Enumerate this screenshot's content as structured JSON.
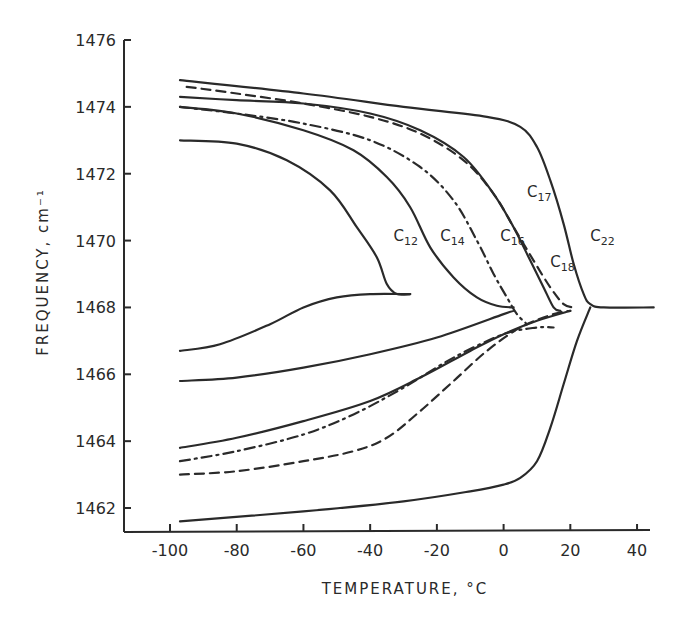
{
  "chart_data": {
    "type": "line",
    "title": "",
    "xlabel": "TEMPERATURE, °C",
    "ylabel": "FREQUENCY, cm⁻¹",
    "xlim": [
      -112,
      46
    ],
    "ylim": [
      1461.3,
      1476
    ],
    "x_ticks": [
      -100,
      -80,
      -60,
      -40,
      -20,
      0,
      20,
      40
    ],
    "x_tick_labels": [
      "-100",
      "-80",
      "-60",
      "-40",
      "-20",
      "0",
      "20",
      "40"
    ],
    "y_ticks": [
      1476,
      1474,
      1472,
      1470,
      1468,
      1466,
      1464,
      1462
    ],
    "y_tick_labels": [
      "1476",
      "1474",
      "1472",
      "1470",
      "1468",
      "1466",
      "1464",
      "1462"
    ],
    "grid": false,
    "legend": "inline curve labels",
    "series": [
      {
        "name": "C12",
        "label_main": "C",
        "label_sub": "12",
        "style": "solid",
        "branch": "upper",
        "x": [
          -97,
          -80,
          -65,
          -52,
          -44,
          -38,
          -35,
          -32,
          -28
        ],
        "y": [
          1473.0,
          1472.9,
          1472.4,
          1471.5,
          1470.4,
          1469.5,
          1468.7,
          1468.4,
          1468.4
        ]
      },
      {
        "name": "C12",
        "label_main": "C",
        "label_sub": "12",
        "style": "solid",
        "branch": "lower",
        "x": [
          -97,
          -85,
          -70,
          -60,
          -50,
          -40,
          -28
        ],
        "y": [
          1466.7,
          1466.9,
          1467.5,
          1468.0,
          1468.3,
          1468.4,
          1468.4
        ]
      },
      {
        "name": "C14",
        "label_main": "C",
        "label_sub": "14",
        "style": "solid",
        "branch": "upper",
        "x": [
          -97,
          -80,
          -60,
          -45,
          -35,
          -28,
          -22,
          -15,
          -8,
          -2,
          3
        ],
        "y": [
          1474.0,
          1473.8,
          1473.3,
          1472.7,
          1471.9,
          1471.0,
          1469.8,
          1468.9,
          1468.3,
          1468.05,
          1468.0
        ]
      },
      {
        "name": "C14",
        "label_main": "C",
        "label_sub": "14",
        "style": "solid",
        "branch": "lower",
        "x": [
          -97,
          -80,
          -60,
          -40,
          -20,
          0,
          3
        ],
        "y": [
          1465.8,
          1465.9,
          1466.2,
          1466.6,
          1467.1,
          1467.8,
          1467.9
        ]
      },
      {
        "name": "C16",
        "label_main": "C",
        "label_sub": "16",
        "style": "dashdot",
        "branch": "upper",
        "x": [
          -97,
          -80,
          -60,
          -40,
          -25,
          -15,
          -8,
          -3,
          1,
          4,
          7
        ],
        "y": [
          1474.0,
          1473.8,
          1473.5,
          1473.0,
          1472.2,
          1471.2,
          1470.0,
          1469.0,
          1468.3,
          1467.8,
          1467.5
        ]
      },
      {
        "name": "C16",
        "label_main": "C",
        "label_sub": "16",
        "style": "dashdot",
        "branch": "lower",
        "x": [
          -97,
          -80,
          -60,
          -45,
          -30,
          -15,
          0,
          10,
          15
        ],
        "y": [
          1463.4,
          1463.7,
          1464.2,
          1464.8,
          1465.6,
          1466.5,
          1467.2,
          1467.4,
          1467.4
        ]
      },
      {
        "name": "C17",
        "label_main": "C",
        "label_sub": "17",
        "style": "solid",
        "branch": "upper",
        "x": [
          -97,
          -80,
          -60,
          -40,
          -25,
          -12,
          -3,
          3,
          8,
          12,
          15,
          17
        ],
        "y": [
          1474.3,
          1474.2,
          1474.1,
          1473.8,
          1473.3,
          1472.5,
          1471.4,
          1470.4,
          1469.4,
          1468.6,
          1468.0,
          1467.9
        ]
      },
      {
        "name": "C17",
        "label_main": "C",
        "label_sub": "17",
        "style": "solid",
        "branch": "lower",
        "x": [
          -97,
          -80,
          -60,
          -40,
          -25,
          -10,
          0,
          10,
          20
        ],
        "y": [
          1463.8,
          1464.1,
          1464.6,
          1465.2,
          1465.9,
          1466.7,
          1467.2,
          1467.6,
          1467.9
        ]
      },
      {
        "name": "C18",
        "label_main": "C",
        "label_sub": "18",
        "style": "dashed",
        "branch": "upper",
        "x": [
          -95,
          -80,
          -60,
          -40,
          -25,
          -12,
          -3,
          3,
          9,
          14,
          18,
          21
        ],
        "y": [
          1474.6,
          1474.4,
          1474.1,
          1473.7,
          1473.2,
          1472.4,
          1471.4,
          1470.4,
          1469.4,
          1468.6,
          1468.1,
          1468.0
        ]
      },
      {
        "name": "C18",
        "label_main": "C",
        "label_sub": "18",
        "style": "dashed",
        "branch": "lower",
        "x": [
          -97,
          -80,
          -60,
          -45,
          -35,
          -25,
          -15,
          -5,
          5,
          15,
          20
        ],
        "y": [
          1463.0,
          1463.1,
          1463.4,
          1463.7,
          1464.1,
          1464.9,
          1465.8,
          1466.7,
          1467.4,
          1467.8,
          1467.9
        ]
      },
      {
        "name": "C22",
        "label_main": "C",
        "label_sub": "22",
        "style": "solid",
        "branch": "upper",
        "x": [
          -97,
          -60,
          -30,
          -5,
          5,
          10,
          14,
          18,
          21,
          24,
          26,
          30,
          45
        ],
        "y": [
          1474.8,
          1474.4,
          1474.0,
          1473.7,
          1473.4,
          1472.8,
          1471.8,
          1470.5,
          1469.3,
          1468.4,
          1468.1,
          1468.0,
          1468.0
        ]
      },
      {
        "name": "C22",
        "label_main": "C",
        "label_sub": "22",
        "style": "solid",
        "branch": "lower",
        "x": [
          -97,
          -60,
          -30,
          -10,
          0,
          5,
          10,
          14,
          18,
          22,
          26
        ],
        "y": [
          1461.6,
          1461.9,
          1462.2,
          1462.5,
          1462.7,
          1462.9,
          1463.4,
          1464.4,
          1465.7,
          1467.0,
          1468.0
        ]
      }
    ],
    "annotations": [
      {
        "text": "C12",
        "x": -33,
        "y": 1470.0
      },
      {
        "text": "C14",
        "x": -19,
        "y": 1470.0
      },
      {
        "text": "C16",
        "x": -1,
        "y": 1470.0
      },
      {
        "text": "C17",
        "x": 7,
        "y": 1471.3
      },
      {
        "text": "C18",
        "x": 14,
        "y": 1469.2
      },
      {
        "text": "C22",
        "x": 26,
        "y": 1470.0
      }
    ]
  }
}
